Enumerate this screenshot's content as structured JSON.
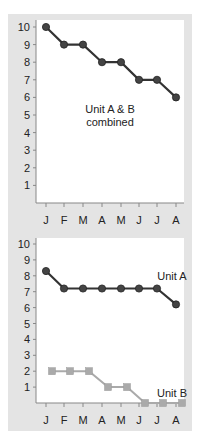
{
  "chart_data": [
    {
      "type": "line",
      "title": "",
      "annotation": "Unit A & B\ncombined",
      "annotation_lines": [
        "Unit A & B",
        "combined"
      ],
      "categories": [
        "J",
        "F",
        "M",
        "A",
        "M",
        "J",
        "J",
        "A"
      ],
      "series": [
        {
          "name": "Unit A & B combined",
          "values": [
            10,
            9,
            9,
            8,
            8,
            7,
            7,
            6
          ],
          "color": "#333333",
          "marker": "circle"
        }
      ],
      "yticks": [
        1,
        2,
        3,
        4,
        5,
        6,
        7,
        8,
        9,
        10
      ],
      "ylim": [
        0,
        10
      ],
      "xlabel": "",
      "ylabel": "",
      "grid": false
    },
    {
      "type": "line",
      "title": "",
      "categories": [
        "J",
        "F",
        "M",
        "A",
        "M",
        "J",
        "J",
        "A"
      ],
      "series": [
        {
          "name": "Unit A",
          "values": [
            8.3,
            7.2,
            7.2,
            7.2,
            7.2,
            7.2,
            7.2,
            6.2
          ],
          "color": "#333333",
          "marker": "circle"
        },
        {
          "name": "Unit B",
          "values": [
            2,
            2,
            2,
            1,
            1,
            0,
            0,
            0
          ],
          "color": "#aaaaaa",
          "marker": "square"
        }
      ],
      "yticks": [
        1,
        2,
        3,
        4,
        5,
        6,
        7,
        8,
        9,
        10
      ],
      "ylim": [
        0,
        10
      ],
      "xlabel": "",
      "ylabel": "",
      "grid": false
    }
  ],
  "labels": {
    "top_annotation_1": "Unit A & B",
    "top_annotation_2": "combined",
    "unit_a": "Unit A",
    "unit_b": "Unit B"
  }
}
